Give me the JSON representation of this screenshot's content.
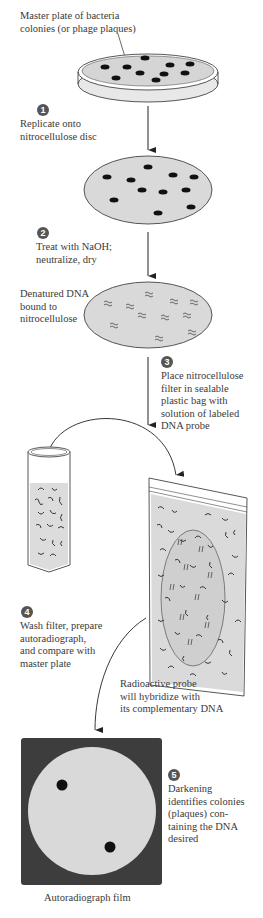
{
  "labels": {
    "master_plate": [
      "Master plate of bacteria",
      "colonies (or phage plaques)"
    ],
    "denatured": [
      "Denatured DNA",
      "bound to",
      "nitrocellulose"
    ],
    "radioactive": [
      "Radioactive probe",
      "will hybridize with",
      "its complementary DNA"
    ],
    "film": "Autoradiograph film"
  },
  "steps": [
    {
      "number": "1",
      "text": [
        "Replicate onto",
        "nitrocellulose disc"
      ]
    },
    {
      "number": "2",
      "text": [
        "Treat with NaOH;",
        "neutralize, dry"
      ]
    },
    {
      "number": "3",
      "text": [
        "Place nitrocellulose",
        "filter in sealable",
        "plastic bag with",
        "solution of labeled",
        "DNA probe"
      ]
    },
    {
      "number": "4",
      "text": [
        "Wash filter, prepare",
        "autoradiograph,",
        "and compare with",
        "master plate"
      ]
    },
    {
      "number": "5",
      "text": [
        "Darkening",
        "identifies colonies",
        "(plaques) con-",
        "taining the DNA",
        "desired"
      ]
    }
  ],
  "colors": {
    "fill_gray": "#d9d9d9",
    "film_dark": "#3d3d3d",
    "dot": "#111111",
    "step_badge": "#555555"
  }
}
